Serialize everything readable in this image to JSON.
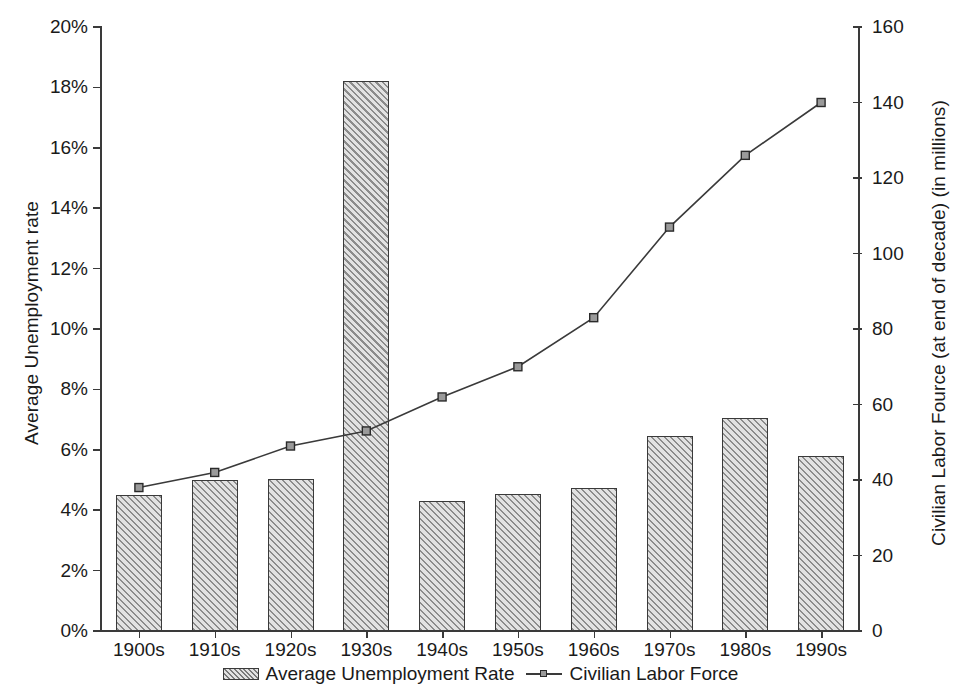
{
  "chart_data": {
    "type": "bar",
    "title": "",
    "subtitle": "",
    "xlabel": "",
    "ylabel": "Average Unemployment rate",
    "ylabel_right": "Civilian Labor Fource (at end of decade) (in millions)",
    "categories": [
      "1900s",
      "1910s",
      "1920s",
      "1930s",
      "1940s",
      "1950s",
      "1960s",
      "1970s",
      "1980s",
      "1990s"
    ],
    "series": [
      {
        "name": "Average Unemployment Rate",
        "type": "bar",
        "axis": "left",
        "unit": "%",
        "values": [
          4.5,
          5.0,
          5.05,
          18.2,
          4.3,
          4.55,
          4.75,
          6.45,
          7.05,
          5.8
        ]
      },
      {
        "name": "Civilian Labor Force",
        "type": "line",
        "axis": "right",
        "unit": "millions",
        "values": [
          38,
          42,
          49,
          53,
          62,
          70,
          83,
          107,
          126,
          140
        ]
      }
    ],
    "ylim": [
      0,
      20
    ],
    "ylim_right": [
      0,
      160
    ],
    "yticks": [
      "0%",
      "2%",
      "4%",
      "6%",
      "8%",
      "10%",
      "12%",
      "14%",
      "16%",
      "18%",
      "20%"
    ],
    "ytick_values": [
      0,
      2,
      4,
      6,
      8,
      10,
      12,
      14,
      16,
      18,
      20
    ],
    "yticks_right": [
      "0",
      "20",
      "40",
      "60",
      "80",
      "100",
      "120",
      "140",
      "160"
    ],
    "ytick_values_right": [
      0,
      20,
      40,
      60,
      80,
      100,
      120,
      140,
      160
    ],
    "grid": false,
    "legend_position": "bottom",
    "legend": [
      {
        "label": "Average Unemployment Rate",
        "marker": "hatched-bar-swatch"
      },
      {
        "label": "Civilian Labor Force",
        "marker": "line-with-square-marker"
      }
    ],
    "colors": {
      "bar_hatch": "#8c8c8c",
      "bar_background": "#e2e2e2",
      "bar_border": "#3a3a3a",
      "line": "#3a3a3a",
      "marker_fill": "#9a9a9a",
      "axis": "#3a3a3a",
      "text": "#1a1a1a",
      "plot_background": "#ffffff"
    }
  }
}
